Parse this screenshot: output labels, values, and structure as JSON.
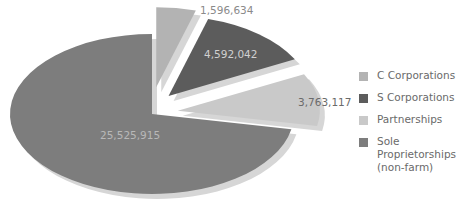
{
  "chart_data": {
    "type": "pie",
    "title": "",
    "categories": [
      "C Corporations",
      "S Corporations",
      "Partnerships",
      "Sole Proprietorships (non-farm)"
    ],
    "values": [
      1596634,
      4592042,
      3763117,
      25525915
    ],
    "data_labels": [
      "1,596,634",
      "4,592,042",
      "3,763,117",
      "25,525,915"
    ],
    "colors": [
      "#b3b3b3",
      "#5c5c5c",
      "#c9c9c9",
      "#7d7d7d"
    ],
    "exploded": [
      true,
      true,
      true,
      false
    ],
    "legend_position": "right",
    "style": "3D tilted pie with shadow"
  },
  "legend": {
    "items": [
      {
        "label": "C Corporations",
        "color": "#b3b3b3"
      },
      {
        "label": "S Corporations",
        "color": "#5c5c5c"
      },
      {
        "label": "Partnerships",
        "color": "#c9c9c9"
      },
      {
        "label": "Sole Proprietorships\n(non-farm)",
        "color": "#7d7d7d"
      }
    ]
  }
}
